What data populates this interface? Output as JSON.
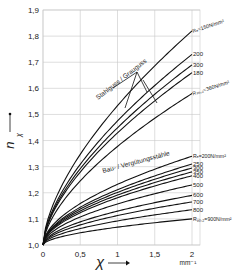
{
  "chart_data": {
    "type": "line",
    "title": "",
    "xlabel": "χ",
    "xunit": "mm⁻¹",
    "ylabel": "n_χ",
    "xlim": [
      0,
      2
    ],
    "ylim": [
      1.0,
      1.9
    ],
    "grid": true,
    "x_ticks": [
      "0",
      "0,5",
      "1",
      "1,5",
      "2"
    ],
    "y_ticks": [
      "1,0",
      "1,1",
      "1,2",
      "1,3",
      "1,4",
      "1,5",
      "1,6",
      "1,7",
      "1,8",
      "1,9"
    ],
    "annotations": [
      {
        "text": "Stahlguss / Grauguss",
        "group": "cast"
      },
      {
        "text": "Bau- / Vergütungsstähle",
        "group": "steel"
      }
    ],
    "series": [
      {
        "group": "cast",
        "name": "Rₑ=150N/mm²",
        "label": "Rₑ=150N/mm²",
        "end_value": 1.82
      },
      {
        "group": "cast",
        "name": "200",
        "label": "200",
        "end_value": 1.73
      },
      {
        "group": "cast",
        "name": "300",
        "label": "300",
        "end_value": 1.69
      },
      {
        "group": "cast",
        "name": "180",
        "label": "180",
        "end_value": 1.66
      },
      {
        "group": "cast",
        "name": "Rₚ₀,₂=360N/mm²",
        "label": "Rₚ₀,₂=360N/mm²",
        "end_value": 1.58
      },
      {
        "group": "steel",
        "name": "Rₑ=200N/mm²",
        "label": "Rₑ=200N/mm²",
        "end_value": 1.34
      },
      {
        "group": "steel",
        "name": "250",
        "label": "250",
        "end_value": 1.31
      },
      {
        "group": "steel",
        "name": "300",
        "label": "300",
        "end_value": 1.295
      },
      {
        "group": "steel",
        "name": "350",
        "label": "350",
        "end_value": 1.28
      },
      {
        "group": "steel",
        "name": "400",
        "label": "400",
        "end_value": 1.265
      },
      {
        "group": "steel",
        "name": "500",
        "label": "500",
        "end_value": 1.23
      },
      {
        "group": "steel",
        "name": "600",
        "label": "600",
        "end_value": 1.19
      },
      {
        "group": "steel",
        "name": "700",
        "label": "700",
        "end_value": 1.165
      },
      {
        "group": "steel",
        "name": "800",
        "label": "800",
        "end_value": 1.135
      },
      {
        "group": "steel",
        "name": "Rₚ₀,₂=900N/mm²",
        "label": "Rₚ₀,₂=900N/mm²",
        "end_value": 1.1
      }
    ]
  }
}
